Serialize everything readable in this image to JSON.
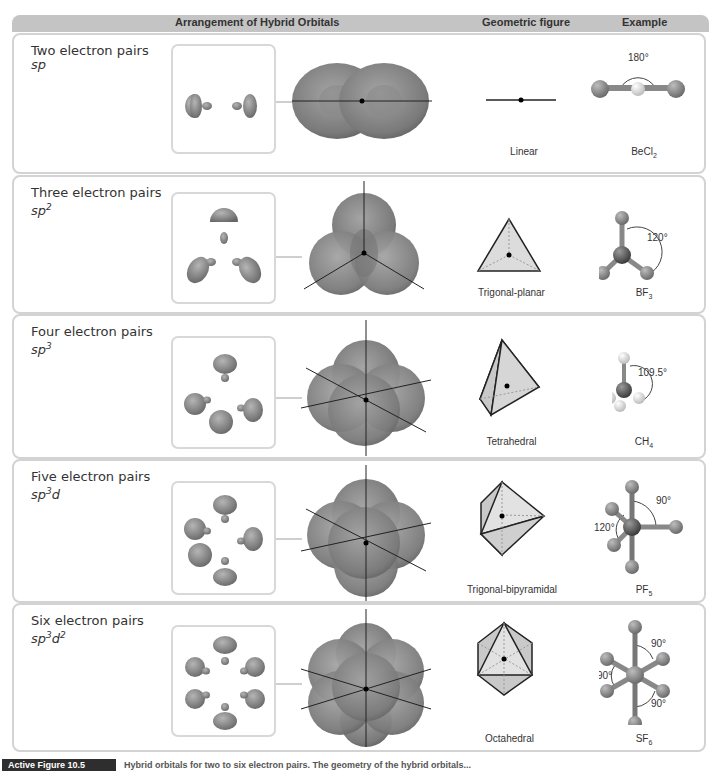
{
  "header": {
    "col_arrangement": "Arrangement of Hybrid Orbitals",
    "col_geometric": "Geometric figure",
    "col_example": "Example"
  },
  "rows": [
    {
      "pairs": "Two electron pairs",
      "hybrid_base": "sp",
      "hybrid_sup1": "",
      "hybrid_mid": "",
      "hybrid_sup2": "",
      "geometry": "Linear",
      "example_base": "BeCl",
      "example_sub": "2",
      "angles": [
        "180°"
      ]
    },
    {
      "pairs": "Three electron pairs",
      "hybrid_base": "sp",
      "hybrid_sup1": "2",
      "hybrid_mid": "",
      "hybrid_sup2": "",
      "geometry": "Trigonal-planar",
      "example_base": "BF",
      "example_sub": "3",
      "angles": [
        "120°"
      ]
    },
    {
      "pairs": "Four electron pairs",
      "hybrid_base": "sp",
      "hybrid_sup1": "3",
      "hybrid_mid": "",
      "hybrid_sup2": "",
      "geometry": "Tetrahedral",
      "example_base": "CH",
      "example_sub": "4",
      "angles": [
        "109.5°"
      ]
    },
    {
      "pairs": "Five electron pairs",
      "hybrid_base": "sp",
      "hybrid_sup1": "3",
      "hybrid_mid": "d",
      "hybrid_sup2": "",
      "geometry": "Trigonal-bipyramidal",
      "example_base": "PF",
      "example_sub": "5",
      "angles": [
        "90°",
        "120°"
      ]
    },
    {
      "pairs": "Six electron pairs",
      "hybrid_base": "sp",
      "hybrid_sup1": "3",
      "hybrid_mid": "d",
      "hybrid_sup2": "2",
      "geometry": "Octahedral",
      "example_base": "SF",
      "example_sub": "6",
      "angles": [
        "90°",
        "90°",
        "90°"
      ]
    }
  ],
  "caption": {
    "tag": "Active Figure 10.5",
    "text": "Hybrid orbitals for two to six electron pairs. The geometry of the hybrid orbitals..."
  },
  "colors": {
    "header_bg": "#c4c4c4",
    "row_border": "#d3d3d3",
    "orbital_fill": "#8e8e8e",
    "atom_dark": "#555555",
    "atom_light": "#e2e2e2",
    "polyhedron_fill": "#dcdcdc"
  }
}
